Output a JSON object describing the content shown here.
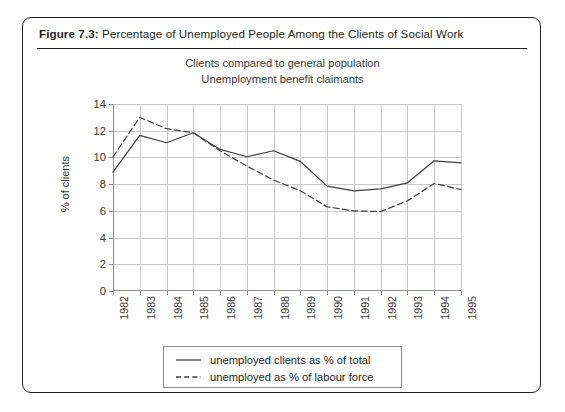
{
  "figure": {
    "label": "Figure 7.3:",
    "caption": "Percentage of Unemployed People Among the Clients of Social Work"
  },
  "chart_data": {
    "type": "line",
    "title": "",
    "subtitle_line1": "Clients compared to general population",
    "subtitle_line2": "Unemployment benefit claimants",
    "xlabel": "",
    "ylabel": "% of clients",
    "categories": [
      "1982",
      "1983",
      "1984",
      "1985",
      "1986",
      "1987",
      "1988",
      "1989",
      "1990",
      "1991",
      "1992",
      "1993",
      "1994",
      "1995"
    ],
    "ylim": [
      0,
      14
    ],
    "yticks": [
      0,
      2,
      4,
      6,
      8,
      10,
      12,
      14
    ],
    "grid": true,
    "legend_position": "bottom",
    "series": [
      {
        "name": "unemployed clients as % of total",
        "style": "solid",
        "color": "#3f3f3f",
        "values": [
          8.9,
          11.65,
          11.1,
          11.85,
          10.6,
          10.05,
          10.5,
          9.7,
          7.85,
          7.5,
          7.65,
          8.1,
          9.75,
          9.6
        ]
      },
      {
        "name": "unemployed as % of labour force",
        "style": "dashed",
        "color": "#3f3f3f",
        "values": [
          10.05,
          13.0,
          12.15,
          11.85,
          10.5,
          9.35,
          8.3,
          7.5,
          6.3,
          6.0,
          5.95,
          6.75,
          8.05,
          7.6
        ]
      }
    ]
  }
}
